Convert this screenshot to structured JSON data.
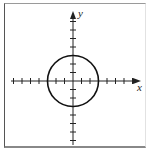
{
  "figure": {
    "type": "coordinate-plane-graph",
    "x_axis_label": "x",
    "y_axis_label": "y",
    "axis_color": "#222222",
    "curve_color": "#111111"
  },
  "graph": {
    "origin_px": [
      73,
      81
    ],
    "unit_px": 8.5,
    "x_ticks": [
      -7,
      -6,
      -5,
      -4,
      -3,
      -2,
      -1,
      1,
      2,
      3,
      4,
      5,
      6,
      7
    ],
    "y_ticks": [
      -7,
      -6,
      -5,
      -4,
      -3,
      -2,
      -1,
      1,
      2,
      3,
      4,
      5,
      6,
      7
    ],
    "curve": {
      "shape": "circle",
      "center": [
        0,
        0
      ],
      "radius": 3,
      "equation": "x^2 + y^2 = 9"
    }
  }
}
